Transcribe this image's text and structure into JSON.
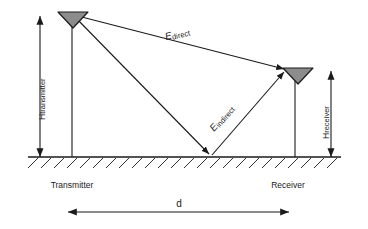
{
  "diagram": {
    "colors": {
      "line": "#1a1a1a",
      "antenna_fill": "#8c8c8c",
      "antenna_stroke": "#1a1a1a",
      "text": "#1a1a1a",
      "background": "#ffffff"
    },
    "nodes": [
      {
        "id": "transmitter",
        "label": "Transmitter",
        "icon": "antenna-icon"
      },
      {
        "id": "receiver",
        "label": "Receiver",
        "icon": "antenna-icon"
      }
    ],
    "dimensions": [
      {
        "id": "h-transmitter",
        "symbol": "H",
        "subscript": "transmitter",
        "orientation": "vertical"
      },
      {
        "id": "h-receiver",
        "symbol": "H",
        "subscript": "receiver",
        "orientation": "vertical"
      },
      {
        "id": "separation",
        "symbol": "d",
        "orientation": "horizontal"
      }
    ],
    "rays": [
      {
        "id": "direct-ray",
        "symbol": "E",
        "subscript": "direct"
      },
      {
        "id": "indirect-ray",
        "symbol": "E",
        "subscript": "indirect"
      }
    ],
    "ground": {
      "id": "ground-line",
      "label": ""
    }
  }
}
